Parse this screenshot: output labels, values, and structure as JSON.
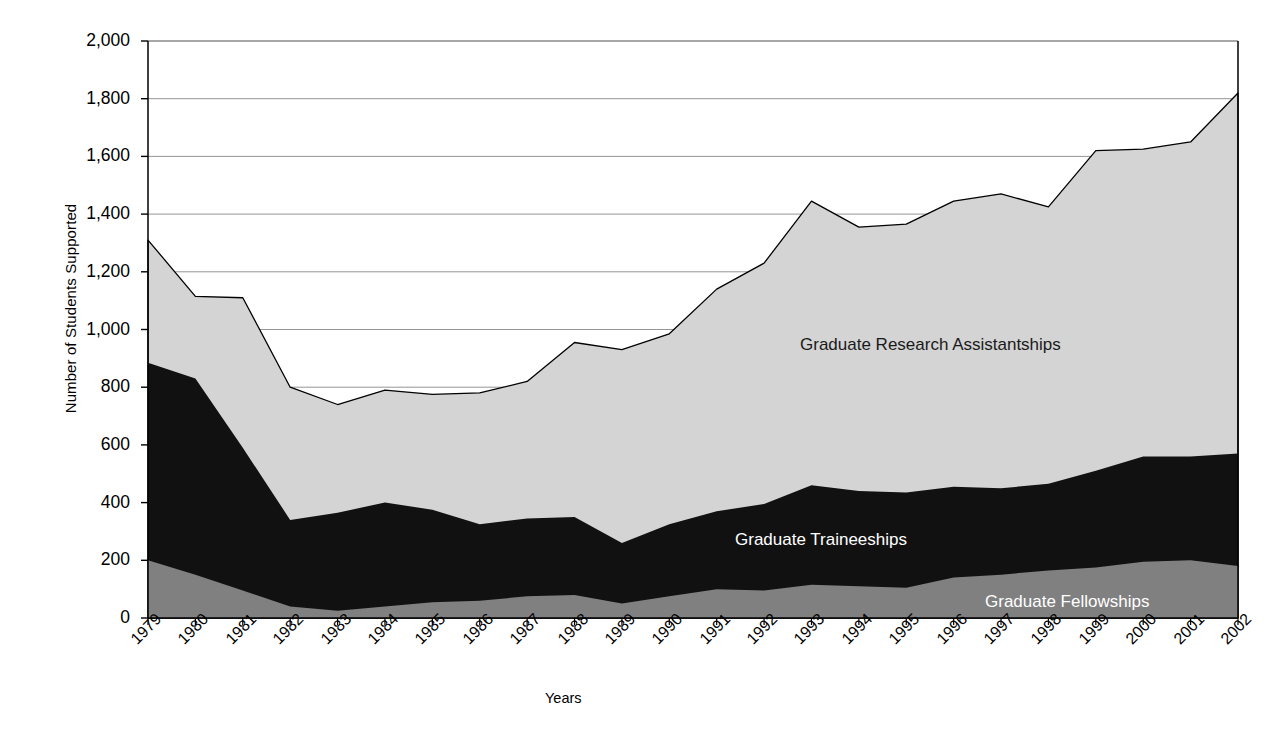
{
  "chart_data": {
    "type": "area",
    "stacked": true,
    "title": "",
    "subtitle": "",
    "xlabel": "Years",
    "ylabel": "Number of Students Supported",
    "categories": [
      "1979",
      "1980",
      "1981",
      "1982",
      "1983",
      "1984",
      "1985",
      "1986",
      "1987",
      "1988",
      "1989",
      "1990",
      "1991",
      "1992",
      "1993",
      "1994",
      "1995",
      "1996",
      "1997",
      "1998",
      "1999",
      "2000",
      "2001",
      "2002"
    ],
    "x": [
      1979,
      1980,
      1981,
      1982,
      1983,
      1984,
      1985,
      1986,
      1987,
      1988,
      1989,
      1990,
      1991,
      1992,
      1993,
      1994,
      1995,
      1996,
      1997,
      1998,
      1999,
      2000,
      2001,
      2002
    ],
    "ylim": [
      0,
      2000
    ],
    "xlim": [
      1979,
      2002
    ],
    "yticks": [
      "0",
      "200",
      "400",
      "600",
      "800",
      "1,000",
      "1,200",
      "1,400",
      "1,600",
      "1,800",
      "2,000"
    ],
    "ytick_values": [
      0,
      200,
      400,
      600,
      800,
      1000,
      1200,
      1400,
      1600,
      1800,
      2000
    ],
    "ytick_step": 200,
    "grid": true,
    "grid_axis": "y",
    "legend": "inline-labels",
    "series": [
      {
        "name": "Graduate Fellowships",
        "color": "#808080",
        "label_color": "#ffffff",
        "values": [
          200,
          150,
          95,
          40,
          25,
          40,
          55,
          60,
          75,
          80,
          50,
          75,
          100,
          95,
          115,
          110,
          105,
          140,
          150,
          165,
          175,
          195,
          200,
          180
        ]
      },
      {
        "name": "Graduate Traineeships",
        "color": "#111111",
        "label_color": "#ffffff",
        "values": [
          685,
          680,
          495,
          300,
          340,
          360,
          320,
          265,
          270,
          270,
          210,
          250,
          270,
          300,
          345,
          330,
          330,
          315,
          300,
          300,
          335,
          365,
          360,
          390
        ]
      },
      {
        "name": "Graduate Research Assistantships",
        "color": "#d4d4d4",
        "label_color": "#1a1a1a",
        "values": [
          425,
          285,
          520,
          460,
          375,
          390,
          400,
          455,
          475,
          605,
          670,
          660,
          770,
          835,
          985,
          915,
          930,
          990,
          1020,
          960,
          1110,
          1065,
          1090,
          1250
        ]
      }
    ],
    "cumulative_tops": {
      "fellowships": [
        200,
        150,
        95,
        40,
        25,
        40,
        55,
        60,
        75,
        80,
        50,
        75,
        100,
        95,
        115,
        110,
        105,
        140,
        150,
        165,
        175,
        195,
        200,
        180
      ],
      "traineeships": [
        885,
        830,
        590,
        340,
        365,
        400,
        375,
        325,
        345,
        350,
        260,
        325,
        370,
        395,
        460,
        440,
        435,
        455,
        450,
        465,
        510,
        560,
        560,
        570
      ],
      "total": [
        1310,
        1115,
        1110,
        800,
        740,
        790,
        775,
        780,
        820,
        955,
        930,
        985,
        1140,
        1230,
        1445,
        1355,
        1365,
        1445,
        1470,
        1425,
        1620,
        1625,
        1650,
        1820
      ]
    },
    "series_labels": [
      {
        "text": "Graduate Research Assistantships",
        "x_px": 800,
        "y_px": 335,
        "on": "light"
      },
      {
        "text": "Graduate Traineeships",
        "x_px": 735,
        "y_px": 530,
        "on": "dark"
      },
      {
        "text": "Graduate Fellowships",
        "x_px": 985,
        "y_px": 592,
        "on": "dark"
      }
    ]
  },
  "colors": {
    "fellowships": "#808080",
    "traineeships": "#111111",
    "assistantships": "#d4d4d4",
    "axis": "#000000",
    "grid": "#8a8a8a",
    "background": "#ffffff"
  }
}
